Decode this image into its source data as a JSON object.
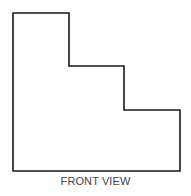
{
  "diagram": {
    "caption": "FRONT VIEW",
    "shape": "stepped-profile",
    "outline_color": "#1a1a1a",
    "caption_color": "#444444",
    "outline_points": "13,13 69,13 69,66 124,66 124,110 180,110 180,171 13,171"
  }
}
